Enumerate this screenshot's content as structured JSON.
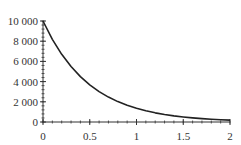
{
  "chart_data": {
    "type": "line",
    "title": "",
    "xlabel": "",
    "ylabel": "",
    "function": "y = 10000 * exp(-2x)",
    "xlim": [
      0,
      2
    ],
    "ylim": [
      0,
      10000
    ],
    "grid": false,
    "legend": null,
    "x_ticks": [
      0,
      0.5,
      1,
      1.5,
      2
    ],
    "x_tick_labels": [
      "0",
      "0.5",
      "1",
      "1.5",
      "2"
    ],
    "x_minor_step": 0.1,
    "y_ticks": [
      0,
      2000,
      4000,
      6000,
      8000,
      10000
    ],
    "y_tick_labels": [
      "0",
      "2 000",
      "4 000",
      "6 000",
      "8 000",
      "10 000"
    ],
    "y_minor_step": 400,
    "series": [
      {
        "name": "decay",
        "color": "#222222",
        "x": [
          0,
          0.1,
          0.2,
          0.3,
          0.4,
          0.5,
          0.6,
          0.7,
          0.8,
          0.9,
          1.0,
          1.1,
          1.2,
          1.3,
          1.4,
          1.5,
          1.6,
          1.7,
          1.8,
          1.9,
          2.0
        ],
        "y": [
          10000,
          8187,
          6703,
          5488,
          4493,
          3679,
          3012,
          2466,
          2019,
          1653,
          1353,
          1108,
          907,
          743,
          608,
          498,
          408,
          334,
          273,
          224,
          183
        ]
      }
    ]
  },
  "colors": {
    "axis": "#333333",
    "curve": "#222222",
    "background": "#ffffff"
  }
}
